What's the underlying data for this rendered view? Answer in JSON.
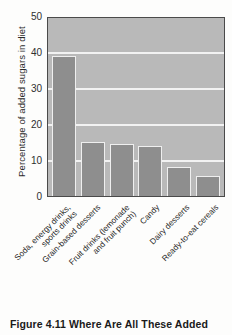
{
  "caption": "Figure 4.11  Where Are All These Added",
  "chart_data": {
    "type": "bar",
    "title": "",
    "xlabel": "",
    "ylabel": "Percentage of added sugars in diet",
    "ylim": [
      0,
      50
    ],
    "yticks": [
      0,
      10,
      20,
      30,
      40,
      50
    ],
    "ytick_labels": [
      "0",
      "10",
      "20",
      "30",
      "40",
      "50"
    ],
    "grid": true,
    "legend": "none",
    "categories": [
      "Soda, energy drinks, sports drinks",
      "Grain-based desserts",
      "Fruit drinks (lemonade and fruit punch)",
      "Candy",
      "Dairy desserts",
      "Ready-to-eat cereals"
    ],
    "category_lines": [
      [
        "Soda, energy drinks,",
        "sports drinks"
      ],
      [
        "Grain-based desserts"
      ],
      [
        "Fruit drinks (lemonade",
        "and fruit punch)"
      ],
      [
        "Candy"
      ],
      [
        "Dairy desserts"
      ],
      [
        "Ready-to-eat cereals"
      ]
    ],
    "values": [
      39,
      15,
      14.5,
      14,
      8,
      5.5
    ],
    "colors": {
      "bar": "#8e8e8e",
      "plot_background": "#b9b9b9",
      "gridline": "#f2f2f2",
      "axis_frame": "#4a4a4a",
      "text": "#252525"
    }
  }
}
